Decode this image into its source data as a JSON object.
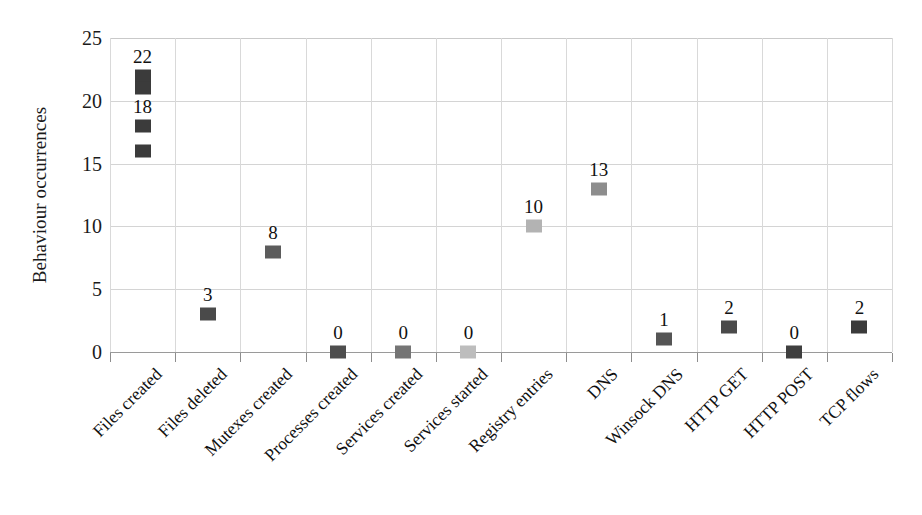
{
  "chart_data": {
    "type": "scatter",
    "title": "",
    "xlabel": "",
    "ylabel": "Behaviour occurrences",
    "ylim": [
      0,
      25
    ],
    "y_ticks": [
      0,
      5,
      10,
      15,
      20,
      25
    ],
    "grid": true,
    "legend": "none",
    "categories": [
      "Files created",
      "Files deleted",
      "Mutexes created",
      "Processes created",
      "Services created",
      "Services started",
      "Registry entries",
      "DNS",
      "Winsock DNS",
      "HTTP GET",
      "HTTP POST",
      "TCP flows"
    ],
    "points": [
      {
        "category": "Files created",
        "values": [
          22,
          21,
          18,
          16
        ],
        "labels": [
          "22",
          "",
          "18",
          ""
        ],
        "colors": [
          "#3b3b3b",
          "#3b3b3b",
          "#3b3b3b",
          "#3b3b3b"
        ]
      },
      {
        "category": "Files deleted",
        "values": [
          3
        ],
        "labels": [
          "3"
        ],
        "colors": [
          "#4a4a4a"
        ]
      },
      {
        "category": "Mutexes created",
        "values": [
          8
        ],
        "labels": [
          "8"
        ],
        "colors": [
          "#5c5c5c"
        ]
      },
      {
        "category": "Processes created",
        "values": [
          0
        ],
        "labels": [
          "0"
        ],
        "colors": [
          "#4e4e4e"
        ]
      },
      {
        "category": "Services created",
        "values": [
          0
        ],
        "labels": [
          "0"
        ],
        "colors": [
          "#757575"
        ]
      },
      {
        "category": "Services started",
        "values": [
          0
        ],
        "labels": [
          "0"
        ],
        "colors": [
          "#bdbdbd"
        ]
      },
      {
        "category": "Registry entries",
        "values": [
          10
        ],
        "labels": [
          "10"
        ],
        "colors": [
          "#b3b3b3"
        ]
      },
      {
        "category": "DNS",
        "values": [
          13
        ],
        "labels": [
          "13"
        ],
        "colors": [
          "#8d8d8d"
        ]
      },
      {
        "category": "Winsock DNS",
        "values": [
          1
        ],
        "labels": [
          "1"
        ],
        "colors": [
          "#555555"
        ]
      },
      {
        "category": "HTTP GET",
        "values": [
          2
        ],
        "labels": [
          "2"
        ],
        "colors": [
          "#4a4a4a"
        ]
      },
      {
        "category": "HTTP POST",
        "values": [
          0
        ],
        "labels": [
          "0"
        ],
        "colors": [
          "#3f3f3f"
        ]
      },
      {
        "category": "TCP flows",
        "values": [
          2
        ],
        "labels": [
          "2"
        ],
        "colors": [
          "#3b3b3b"
        ]
      }
    ]
  },
  "axis": {
    "y_title": "Behaviour occurrences",
    "y_tick_labels": [
      "25",
      "20",
      "15",
      "10",
      "5",
      "0"
    ]
  },
  "colors": {
    "gridline": "#d6d6d6",
    "baseline": "#9a9a9a",
    "text": "#111111",
    "background": "#ffffff"
  }
}
